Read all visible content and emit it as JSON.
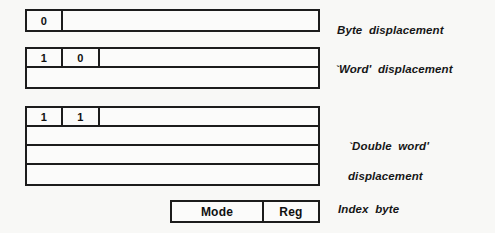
{
  "diagram": {
    "background_color": "#f8f8f6",
    "line_color": "#1c1c1c"
  },
  "groups": [
    {
      "id": "byte",
      "label": "Byte  displacement",
      "rows": [
        {
          "cells": [
            {
              "text": "0",
              "kind": "bit"
            },
            {
              "text": "",
              "kind": "rest"
            }
          ]
        }
      ]
    },
    {
      "id": "word",
      "label": "`Word'  displacement",
      "rows": [
        {
          "cells": [
            {
              "text": "1",
              "kind": "bit"
            },
            {
              "text": "0",
              "kind": "bit"
            },
            {
              "text": "",
              "kind": "rest"
            }
          ]
        },
        {
          "cells": [
            {
              "text": "",
              "kind": "rest"
            }
          ]
        }
      ]
    },
    {
      "id": "dword",
      "label_line1": "`Double  word'",
      "label_line2": "displacement",
      "rows": [
        {
          "cells": [
            {
              "text": "1",
              "kind": "bit"
            },
            {
              "text": "1",
              "kind": "bit"
            },
            {
              "text": "",
              "kind": "rest"
            }
          ]
        },
        {
          "cells": [
            {
              "text": "",
              "kind": "rest"
            }
          ]
        },
        {
          "cells": [
            {
              "text": "",
              "kind": "rest"
            }
          ]
        },
        {
          "cells": [
            {
              "text": "",
              "kind": "rest"
            }
          ]
        }
      ]
    },
    {
      "id": "index",
      "label": "Index  byte",
      "rows": [
        {
          "cells": [
            {
              "text": "Mode",
              "kind": "mode"
            },
            {
              "text": "Reg",
              "kind": "reg"
            }
          ]
        }
      ]
    }
  ]
}
